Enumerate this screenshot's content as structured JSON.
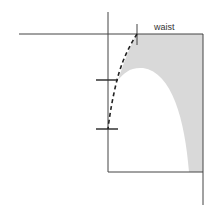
{
  "diagram": {
    "labels": {
      "waist": "waist"
    },
    "colors": {
      "line": "#444444",
      "shaded": "#d9d9d9",
      "background": "#ffffff"
    }
  }
}
